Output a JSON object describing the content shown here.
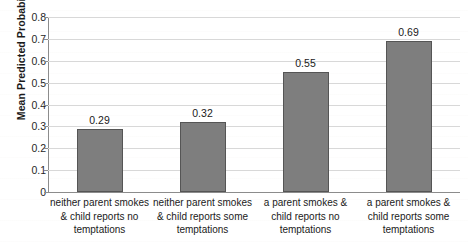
{
  "chart_data": {
    "type": "bar",
    "title": "",
    "xlabel": "",
    "ylabel": "Mean Predicted Probabilities",
    "ylim": [
      0,
      0.8
    ],
    "ytick_labels": [
      "0.8",
      "0.7",
      "0.6",
      "0.5",
      "0.4",
      "0.3",
      "0.2",
      "0.1",
      "0"
    ],
    "ytick_values": [
      0.8,
      0.7,
      0.6,
      0.5,
      0.4,
      0.3,
      0.2,
      0.1,
      0
    ],
    "grid": true,
    "legend": false,
    "bar_color": "#7e7e7e",
    "bar_border_color": "#555555",
    "categories": [
      "neither parent smokes & child reports no temptations",
      "neither parent smokes & child reports some temptations",
      "a parent smokes & child reports no temptations",
      "a parent smokes & child reports some temptations"
    ],
    "category_lines": [
      [
        "neither parent smokes",
        "& child reports no",
        "temptations"
      ],
      [
        "neither parent smokes",
        "& child reports some",
        "temptations"
      ],
      [
        "a parent smokes &",
        "child reports no",
        "temptations"
      ],
      [
        "a parent smokes &",
        "child reports some",
        "temptations"
      ]
    ],
    "values": [
      0.29,
      0.32,
      0.55,
      0.69
    ],
    "value_labels": [
      "0.29",
      "0.32",
      "0.55",
      "0.69"
    ]
  }
}
